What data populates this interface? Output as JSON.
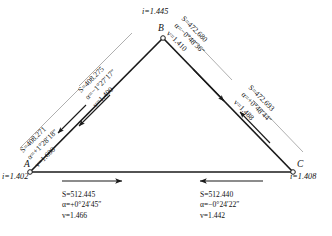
{
  "diagram": {
    "type": "survey-triangle",
    "title": "",
    "stations": [
      {
        "id": "A",
        "label": "A",
        "instrument_height_label": "i=1.402",
        "i": 1.402,
        "x": 30,
        "y": 172
      },
      {
        "id": "B",
        "label": "B",
        "instrument_height_label": "i=1.445",
        "i": 1.445,
        "x": 163,
        "y": 38
      },
      {
        "id": "C",
        "label": "C",
        "instrument_height_label": "i=1.408",
        "i": 1.408,
        "x": 293,
        "y": 172
      }
    ],
    "observations": [
      {
        "id": "A-to-B",
        "from": "A",
        "to": "B",
        "direction": "B-to-A",
        "S_label": "S=408.271",
        "alpha_label": "α=+1°28′18″",
        "v_label": "v=1.600",
        "S": 408.271,
        "alpha": "+1°28'18\"",
        "v": 1.6
      },
      {
        "id": "B-to-A",
        "from": "B",
        "to": "A",
        "direction": "B-to-A",
        "S_label": "S=408.275",
        "alpha_label": "α=−1°27′17″",
        "v_label": "v=1.400",
        "S": 408.275,
        "alpha": "-1°27'17\"",
        "v": 1.4
      },
      {
        "id": "B-to-C",
        "from": "B",
        "to": "C",
        "direction": "B-to-C",
        "S_label": "S=472.680",
        "alpha_label": "α=−0°48′36″",
        "v_label": "v=1.410",
        "S": 472.68,
        "alpha": "-0°48'36\"",
        "v": 1.41
      },
      {
        "id": "C-to-B",
        "from": "C",
        "to": "B",
        "direction": "C-to-B",
        "S_label": "S=472.693",
        "alpha_label": "α=+0°48′44″",
        "v_label": "v=1.488",
        "S": 472.693,
        "alpha": "+0°48'44\"",
        "v": 1.488
      },
      {
        "id": "A-to-C",
        "from": "A",
        "to": "C",
        "direction": "A-to-C",
        "S_label": "S=512.445",
        "alpha_label": "α=+0°24′45″",
        "v_label": "v=1.466",
        "S": 512.445,
        "alpha": "+0°24'45\"",
        "v": 1.466
      },
      {
        "id": "C-to-A",
        "from": "C",
        "to": "A",
        "direction": "C-to-A",
        "S_label": "S=512.440",
        "alpha_label": "α=−0°24′22″",
        "v_label": "v=1.442",
        "S": 512.44,
        "alpha": "-0°24'22\"",
        "v": 1.442
      }
    ],
    "colors": {
      "line": "#1a1a1a",
      "leader": "#8a8a8a",
      "text": "#111111",
      "background": "#ffffff"
    }
  }
}
